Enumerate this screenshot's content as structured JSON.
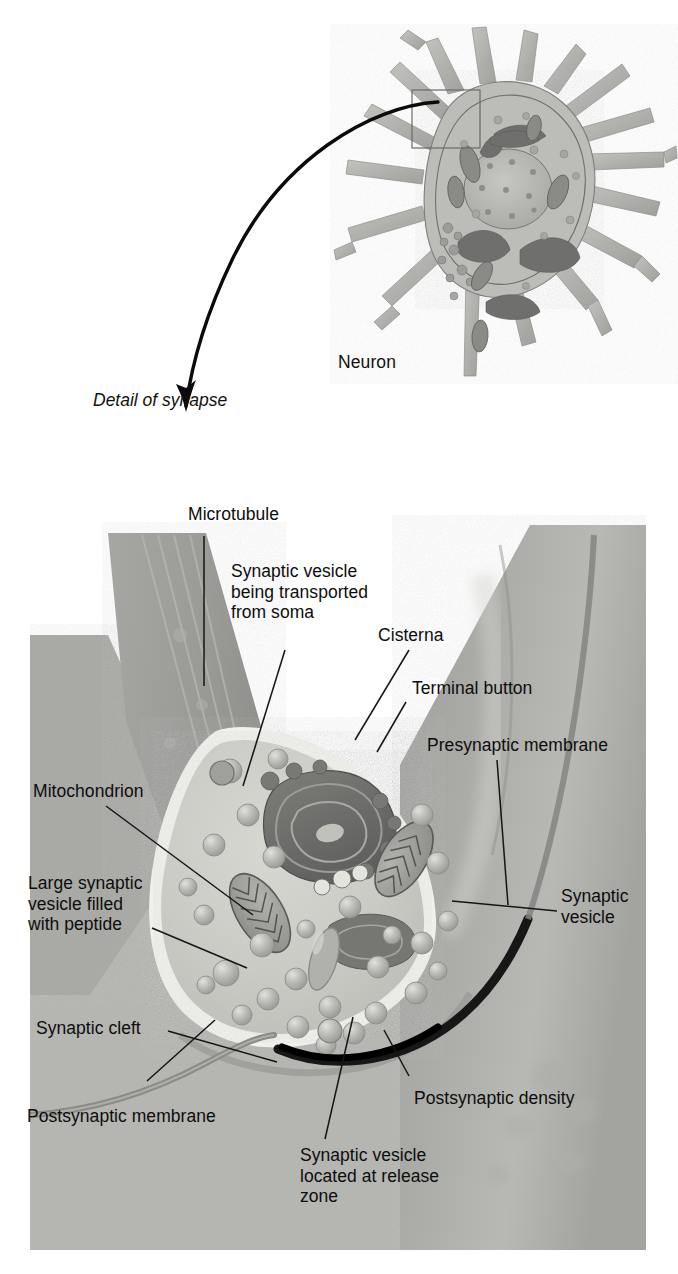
{
  "figure": {
    "title": "Detail of synapse",
    "top_panel": {
      "label": "Neuron",
      "description": "Grayscale illustration of a neuron soma with dendrites, nucleus, mitochondria, Golgi apparatus and endoplasmic reticulum; a small rectangle marks the synapse region."
    },
    "connector": {
      "caption_line1": "Detail of",
      "caption_line2": "synapse",
      "caption": "Detail of\nsynapse"
    },
    "bottom_panel": {
      "description": "Enlarged view of an axon terminal button forming a synapse on a postsynaptic cell."
    }
  },
  "labels": [
    {
      "id": "microtubule",
      "text": "Microtubule"
    },
    {
      "id": "vesicle-transported",
      "text": "Synaptic vesicle\nbeing transported\nfrom soma"
    },
    {
      "id": "cisterna",
      "text": "Cisterna"
    },
    {
      "id": "terminal-button",
      "text": "Terminal button"
    },
    {
      "id": "presynaptic-membrane",
      "text": "Presynaptic membrane"
    },
    {
      "id": "mitochondrion",
      "text": "Mitochondrion"
    },
    {
      "id": "large-peptide-vesicle",
      "text": "Large synaptic\nvesicle filled\nwith peptide"
    },
    {
      "id": "synaptic-vesicle",
      "text": "Synaptic\nvesicle"
    },
    {
      "id": "synaptic-cleft",
      "text": "Synaptic cleft"
    },
    {
      "id": "postsynaptic-density",
      "text": "Postsynaptic density"
    },
    {
      "id": "postsynaptic-membrane",
      "text": "Postsynaptic membrane"
    },
    {
      "id": "vesicle-release-zone",
      "text": "Synaptic vesicle\nlocated at release\nzone"
    }
  ],
  "colors": {
    "background": "#ffffff",
    "text": "#0d0d0d",
    "leader_line": "#151515",
    "panel_background": "#b9b9b6",
    "cytoplasm": "#cecec9",
    "membrane_highlight": "#f2f2ee",
    "axon": "#9d9d9a",
    "postsynaptic_cell": "#a8a8a5",
    "vesicle": "#b4b4b0",
    "vesicle_highlight": "#dedeDA",
    "mitochondrion": "#8a8a87",
    "cisterna": "#6e6e6c",
    "postsynaptic_density": "#1d1d1d",
    "neuron_body": "#b3b3b0",
    "neuron_organelle": "#7b7b79"
  }
}
